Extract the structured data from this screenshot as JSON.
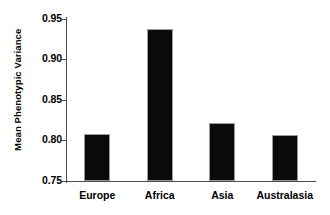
{
  "chart_data": {
    "type": "bar",
    "title": "",
    "subtitle": "",
    "xlabel": "",
    "ylabel": "Mean Phenotypic Variance",
    "categories": [
      "Europe",
      "Africa",
      "Asia",
      "Australasia"
    ],
    "values": [
      0.808,
      0.938,
      0.821,
      0.807
    ],
    "series": [
      {
        "name": "Mean Phenotypic Variance",
        "values": [
          0.808,
          0.938,
          0.821,
          0.807
        ]
      }
    ],
    "ylim": [
      0.75,
      0.95
    ],
    "xlim": [
      0,
      4
    ],
    "ytick_labels": [
      "0.95",
      "0.90",
      "0.85",
      "0.80",
      "0.75"
    ],
    "ytick_values": [
      0.95,
      0.9,
      0.85,
      0.8,
      0.75
    ],
    "grid": false,
    "legend": false,
    "legend_position": "none",
    "bar_color": "#0a0a0a",
    "axis_color": "#4c4c4c",
    "background_color": "#ffffff",
    "annotations": []
  },
  "axis": {
    "y_title": "Mean Phenotypic Variance"
  }
}
